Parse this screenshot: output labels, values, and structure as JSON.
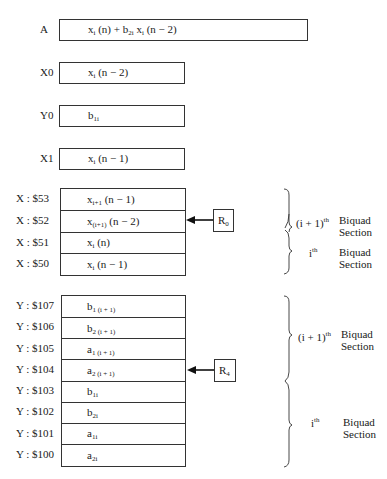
{
  "registers": [
    {
      "label": "A",
      "content": "x_i (n) + b_2i x_i (n − 2)"
    },
    {
      "label": "X0",
      "content": "x_i (n − 2)"
    },
    {
      "label": "Y0",
      "content": "b_1i"
    },
    {
      "label": "X1",
      "content": "x_i (n − 1)"
    }
  ],
  "x_memory": {
    "rows": [
      {
        "address": "X : $53",
        "content": "x_i+1 (n − 1)"
      },
      {
        "address": "X : $52",
        "content": "x_(i+1) (n − 2)"
      },
      {
        "address": "X : $51",
        "content": "x_i (n)"
      },
      {
        "address": "X : $50",
        "content": "x_i (n − 1)"
      }
    ],
    "pointer": {
      "label": "R0",
      "points_to": "X : $52"
    },
    "sections": [
      {
        "label": "(i + 1)th Biquad Section"
      },
      {
        "label": "ith Biquad Section"
      }
    ]
  },
  "y_memory": {
    "rows": [
      {
        "address": "Y : $107",
        "content": "b_1 (i + 1)"
      },
      {
        "address": "Y : $106",
        "content": "b_2 (i + 1)"
      },
      {
        "address": "Y : $105",
        "content": "a_1 (i + 1)"
      },
      {
        "address": "Y : $104",
        "content": "a_2 (i + 1)"
      },
      {
        "address": "Y : $103",
        "content": "b_1i"
      },
      {
        "address": "Y : $102",
        "content": "b_2i"
      },
      {
        "address": "Y : $101",
        "content": "a_1i"
      },
      {
        "address": "Y : $100",
        "content": "a_2i"
      }
    ],
    "pointer": {
      "label": "R4",
      "points_to": "Y : $104"
    },
    "sections": [
      {
        "label": "(i + 1)th Biquad Section"
      },
      {
        "label": "ith Biquad Section"
      }
    ]
  },
  "text": {
    "A": "A",
    "X0": "X0",
    "Y0": "Y0",
    "X1": "X1",
    "x53": "X : $53",
    "x52": "X : $52",
    "x51": "X : $51",
    "x50": "X : $50",
    "y107": "Y : $107",
    "y106": "Y : $106",
    "y105": "Y : $105",
    "y104": "Y : $104",
    "y103": "Y : $103",
    "y102": "Y : $102",
    "y101": "Y : $101",
    "y100": "Y : $100",
    "biquad": "Biquad",
    "section": "Section",
    "th": "th",
    "i_plus_1": "(i + 1)",
    "i": "i"
  }
}
